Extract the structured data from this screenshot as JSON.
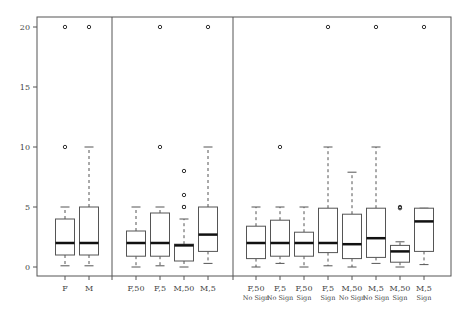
{
  "chart_data": {
    "type": "boxplot",
    "title": "",
    "xlabel": "",
    "ylabel": "",
    "ylim": [
      0,
      20
    ],
    "yticks": [
      0,
      5,
      10,
      15,
      20
    ],
    "grid": false,
    "legend": null,
    "panels": [
      {
        "name": "sex",
        "boxes": [
          {
            "label": [
              "F"
            ],
            "whisker_low": 0.1,
            "q1": 1.0,
            "median": 2.0,
            "q3": 4.0,
            "whisker_high": 5.0,
            "outliers": [
              10,
              20
            ]
          },
          {
            "label": [
              "M"
            ],
            "whisker_low": 0.1,
            "q1": 1.0,
            "median": 2.0,
            "q3": 5.0,
            "whisker_high": 10.0,
            "outliers": [
              20
            ]
          }
        ]
      },
      {
        "name": "sex-by-group",
        "boxes": [
          {
            "label": [
              "F,50"
            ],
            "whisker_low": 0.0,
            "q1": 0.9,
            "median": 2.0,
            "q3": 3.0,
            "whisker_high": 5.0,
            "outliers": []
          },
          {
            "label": [
              "F,5"
            ],
            "whisker_low": 0.1,
            "q1": 0.9,
            "median": 2.0,
            "q3": 4.5,
            "whisker_high": 5.0,
            "outliers": [
              10,
              20
            ]
          },
          {
            "label": [
              "M,50"
            ],
            "whisker_low": 0.0,
            "q1": 0.5,
            "median": 1.8,
            "q3": 1.9,
            "whisker_high": 4.0,
            "outliers": [
              5,
              5,
              6,
              8
            ]
          },
          {
            "label": [
              "M,5"
            ],
            "whisker_low": 0.3,
            "q1": 1.3,
            "median": 2.7,
            "q3": 5.0,
            "whisker_high": 10.0,
            "outliers": [
              20
            ]
          }
        ]
      },
      {
        "name": "sex-by-group-by-sign",
        "boxes": [
          {
            "label": [
              "F,50",
              "No Sign"
            ],
            "whisker_low": 0.0,
            "q1": 0.7,
            "median": 2.0,
            "q3": 3.4,
            "whisker_high": 5.0,
            "outliers": []
          },
          {
            "label": [
              "F,5",
              "No Sign"
            ],
            "whisker_low": 0.3,
            "q1": 0.9,
            "median": 2.0,
            "q3": 3.9,
            "whisker_high": 5.0,
            "outliers": [
              10
            ]
          },
          {
            "label": [
              "F,50",
              "Sign"
            ],
            "whisker_low": 0.0,
            "q1": 0.9,
            "median": 2.0,
            "q3": 2.9,
            "whisker_high": 5.0,
            "outliers": []
          },
          {
            "label": [
              "F,5",
              "Sign"
            ],
            "whisker_low": 0.1,
            "q1": 1.2,
            "median": 2.0,
            "q3": 4.9,
            "whisker_high": 10.0,
            "outliers": [
              20
            ]
          },
          {
            "label": [
              "M,50",
              "No Sign"
            ],
            "whisker_low": 0.0,
            "q1": 0.7,
            "median": 1.9,
            "q3": 4.4,
            "whisker_high": 7.9,
            "outliers": []
          },
          {
            "label": [
              "M,5",
              "No Sign"
            ],
            "whisker_low": 0.3,
            "q1": 0.8,
            "median": 2.4,
            "q3": 4.9,
            "whisker_high": 10.0,
            "outliers": [
              20
            ]
          },
          {
            "label": [
              "M,50",
              "Sign"
            ],
            "whisker_low": 0.0,
            "q1": 0.4,
            "median": 1.3,
            "q3": 1.8,
            "whisker_high": 2.1,
            "outliers": [
              4.9,
              5.0
            ]
          },
          {
            "label": [
              "M,5",
              "Sign"
            ],
            "whisker_low": 0.2,
            "q1": 1.3,
            "median": 3.8,
            "q3": 4.9,
            "whisker_high": 4.9,
            "outliers": [
              20
            ]
          }
        ]
      }
    ]
  }
}
